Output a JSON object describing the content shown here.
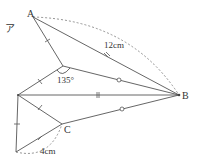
{
  "diagram": {
    "labels": {
      "angle_mark": "ア",
      "A": "A",
      "B": "B",
      "C": "C",
      "AB_length": "12cm",
      "angle": "135°",
      "C_length": "4cm"
    },
    "colors": {
      "line": "#555555",
      "dashed": "#888888",
      "text": "#333333"
    }
  }
}
